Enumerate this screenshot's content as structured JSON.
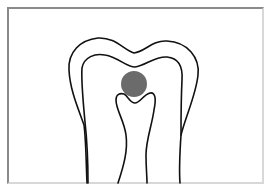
{
  "diagram": {
    "subject": "tooth cross-section",
    "colors": {
      "background": "#ffffff",
      "outline": "#111111",
      "marker": "#6b6b6b",
      "frame_dark": "#8a8a8a",
      "frame_light": "#d8d8d8"
    },
    "parts": [
      {
        "id": "outer-outline",
        "label": "Outer tooth outline"
      },
      {
        "id": "inner-outline",
        "label": "Inner tooth outline"
      },
      {
        "id": "pulp-canal",
        "label": "Central pulp canal"
      },
      {
        "id": "marker-circle",
        "label": "Gray circular marker",
        "cx": 134,
        "cy": 84,
        "r": 13
      }
    ]
  }
}
